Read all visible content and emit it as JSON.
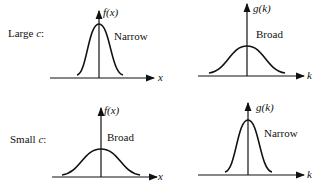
{
  "rows": [
    {
      "label_prefix": "Large ",
      "label_var": "c",
      "label_suffix": ":"
    },
    {
      "label_prefix": "Small ",
      "label_var": "c",
      "label_suffix": ":"
    }
  ],
  "panels": [
    {
      "fn": "f",
      "var": "x",
      "fn_label": "f(x)",
      "axis_label": "x",
      "width_label": "Narrow"
    },
    {
      "fn": "g",
      "var": "k",
      "fn_label": "g(k)",
      "axis_label": "k",
      "width_label": "Broad"
    },
    {
      "fn": "f",
      "var": "x",
      "fn_label": "f(x)",
      "axis_label": "x",
      "width_label": "Broad"
    },
    {
      "fn": "g",
      "var": "k",
      "fn_label": "g(k)",
      "axis_label": "k",
      "width_label": "Narrow"
    }
  ]
}
